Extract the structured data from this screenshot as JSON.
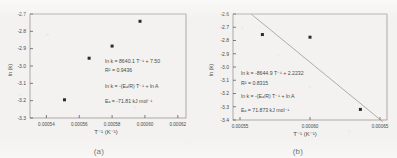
{
  "figure": {
    "background_color": "#f3f2f0",
    "ink_color": "#4a4a4a",
    "marker_color": "#2b2b2b",
    "line_color": "#9a9a9a"
  },
  "panels": [
    {
      "id": "a",
      "caption": "(a)",
      "xlabel": "T⁻¹ (K⁻¹)",
      "ylabel": "ln (k)",
      "annotations": {
        "fit_equation": "ln k = 8640.1 T⁻¹ + 7.50",
        "r_squared": "R² = 0.9436",
        "arrhenius": "ln k = -(Eₐ/R) T⁻¹ + ln A",
        "activation_energy": "Eₐ = -71.81 kJ mol⁻¹"
      },
      "chart_data": {
        "type": "scatter",
        "title": "",
        "xlabel": "T⁻¹ (K⁻¹)",
        "ylabel": "ln (k)",
        "xlim": [
          0.00053,
          0.000625
        ],
        "ylim": [
          -3.3,
          -2.7
        ],
        "xticks": [
          0.00054,
          0.00056,
          0.00058,
          0.0006,
          0.00062
        ],
        "xtick_labels": [
          "0.00054",
          "0.00056",
          "0.00058",
          "0.00060",
          "0.00062"
        ],
        "yticks": [
          -2.7,
          -2.8,
          -2.9,
          -3.0,
          -3.1,
          -3.2,
          -3.3
        ],
        "ytick_labels": [
          "-2.7",
          "-2.8",
          "-2.9",
          "-3.0",
          "-3.1",
          "-3.2",
          "-3.3"
        ],
        "grid": false,
        "legend": "none",
        "series": [
          {
            "name": "ln k data",
            "x": [
              0.000551,
              0.000566,
              0.00058,
              0.000597
            ],
            "y": [
              -3.195,
              -2.955,
              -2.885,
              -2.742
            ]
          }
        ],
        "trendline": {
          "slope": 8640.1,
          "intercept": 7.5,
          "r_squared": 0.9436,
          "x_start": 0.000538,
          "x_end": 0.000601
        }
      }
    },
    {
      "id": "b",
      "caption": "(b)",
      "xlabel": "T⁻¹ (K⁻¹)",
      "ylabel": "ln (k)",
      "annotations": {
        "fit_equation": "ln k = -8644.9 T⁻¹ + 2.2232",
        "r_squared": "R² = 0.8315",
        "arrhenius": "ln k = -(Eₐ/R) T⁻¹ + ln A",
        "activation_energy": "Eₐ = 71.873 kJ mol⁻¹"
      },
      "chart_data": {
        "type": "scatter",
        "title": "",
        "xlabel": "T⁻¹ (K⁻¹)",
        "ylabel": "ln (k)",
        "xlim": [
          0.000545,
          0.000655
        ],
        "ylim": [
          -3.4,
          -2.6
        ],
        "xticks": [
          0.00055,
          0.0006,
          0.00065
        ],
        "xtick_labels": [
          "0.00055",
          "0.00060",
          "0.00065"
        ],
        "yticks": [
          -2.6,
          -2.7,
          -2.8,
          -2.9,
          -3.0,
          -3.1,
          -3.2,
          -3.3,
          -3.4
        ],
        "ytick_labels": [
          "-2.6",
          "-2.7",
          "-2.8",
          "-2.9",
          "-3.0",
          "-3.1",
          "-3.2",
          "-3.3",
          "-3.4"
        ],
        "grid": false,
        "legend": "none",
        "series": [
          {
            "name": "ln k data",
            "x": [
              0.000566,
              0.0006,
              0.000636
            ],
            "y": [
              -2.755,
              -2.775,
              -3.32
            ]
          }
        ],
        "trendline": {
          "slope": -8644.9,
          "intercept": 2.2232,
          "r_squared": 0.8315,
          "x_start": 0.000558,
          "x_end": 0.000652
        }
      }
    }
  ]
}
